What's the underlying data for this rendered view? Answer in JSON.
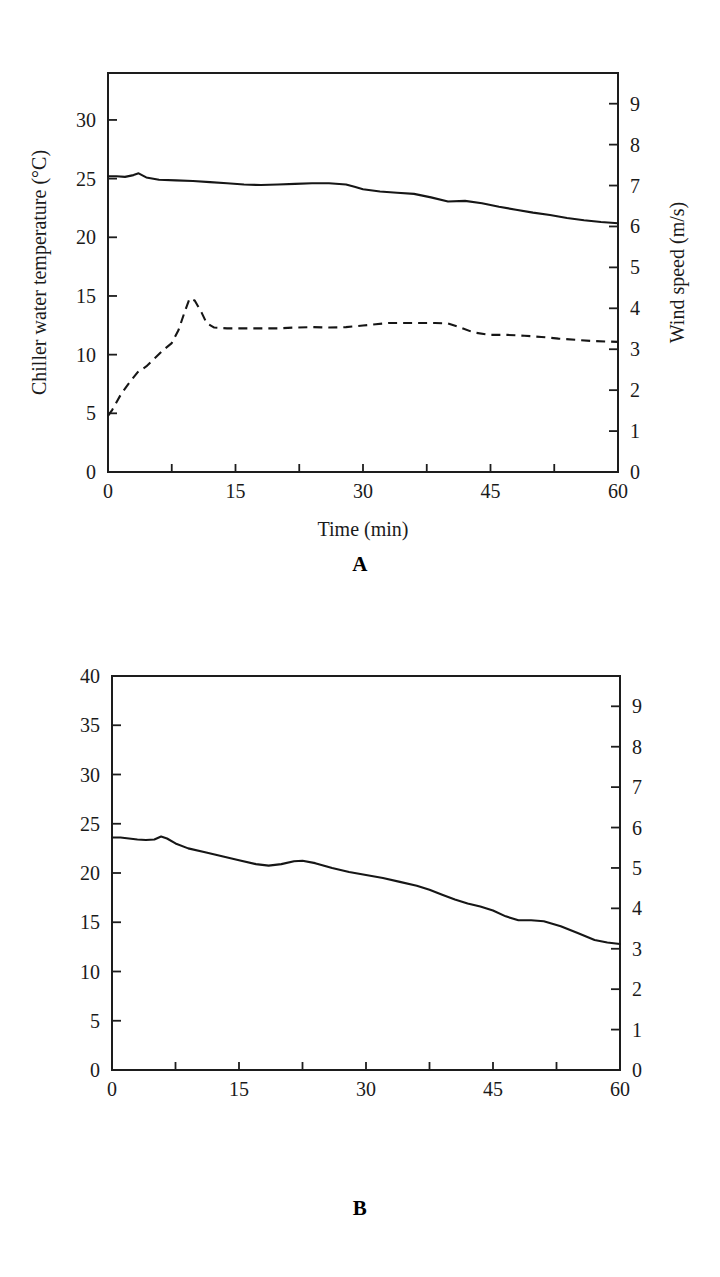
{
  "figure": {
    "panel_a_label": "A",
    "panel_b_label": "B"
  },
  "chart_data": [
    {
      "id": "panel-a",
      "type": "line",
      "title": "",
      "panel_label": "A",
      "xlabel": "Time (min)",
      "ylabel": "Chiller water temperature (°C)",
      "y2label": "Wind speed (m/s)",
      "xlim": [
        0,
        60
      ],
      "ylim": [
        0,
        34
      ],
      "y2lim": [
        0,
        9.75
      ],
      "xticks": [
        0,
        7.5,
        15,
        22.5,
        30,
        37.5,
        45,
        52.5,
        60
      ],
      "xticklabels": [
        "0",
        "",
        "15",
        "",
        "30",
        "",
        "45",
        "",
        "60"
      ],
      "yticks": [
        0,
        5,
        10,
        15,
        20,
        25,
        30
      ],
      "yticklabels": [
        "0",
        "5",
        "10",
        "15",
        "20",
        "25",
        "30"
      ],
      "y2ticks": [
        0,
        1,
        2,
        3,
        4,
        5,
        6,
        7,
        8,
        9
      ],
      "y2ticklabels": [
        "0",
        "1",
        "2",
        "3",
        "4",
        "5",
        "6",
        "7",
        "8",
        "9"
      ],
      "grid": false,
      "legend": "none",
      "series": [
        {
          "name": "Chiller water temperature",
          "style": "solid",
          "axis": "left",
          "unit": "°C",
          "x": [
            0,
            1,
            2,
            3,
            3.6,
            4.5,
            6,
            8,
            10,
            12,
            14,
            16,
            18,
            20,
            22,
            24,
            26,
            28,
            29,
            30,
            32,
            34,
            36,
            38,
            40,
            42,
            44,
            46,
            48,
            50,
            52,
            54,
            56,
            58,
            60
          ],
          "y": [
            25.2,
            25.2,
            25.15,
            25.3,
            25.45,
            25.1,
            24.9,
            24.85,
            24.8,
            24.7,
            24.6,
            24.5,
            24.45,
            24.5,
            24.55,
            24.6,
            24.6,
            24.5,
            24.3,
            24.1,
            23.9,
            23.8,
            23.7,
            23.4,
            23.05,
            23.1,
            22.9,
            22.6,
            22.35,
            22.1,
            21.9,
            21.65,
            21.45,
            21.3,
            21.2
          ]
        },
        {
          "name": "Wind speed",
          "style": "dashed",
          "axis": "right",
          "unit": "m/s",
          "x": [
            0,
            0.5,
            1.5,
            2.5,
            3.5,
            4.5,
            5.5,
            6.5,
            7.5,
            8.3,
            9,
            9.6,
            10.2,
            11,
            11.6,
            12.5,
            14,
            16,
            18,
            20,
            22,
            24,
            26,
            28,
            30,
            31.5,
            33,
            35,
            37,
            38.5,
            40,
            41.5,
            43,
            45,
            47,
            49,
            51,
            53,
            55,
            57,
            60
          ],
          "y_left_equiv": [
            4.8,
            5.3,
            6.6,
            7.6,
            8.5,
            9.0,
            9.7,
            10.4,
            11.0,
            12.1,
            13.6,
            14.8,
            14.6,
            13.6,
            12.7,
            12.3,
            12.25,
            12.25,
            12.25,
            12.25,
            12.3,
            12.35,
            12.3,
            12.35,
            12.5,
            12.6,
            12.7,
            12.7,
            12.7,
            12.7,
            12.65,
            12.3,
            11.9,
            11.7,
            11.7,
            11.6,
            11.5,
            11.35,
            11.25,
            11.15,
            11.1
          ],
          "y": [
            1.37,
            1.52,
            1.89,
            2.18,
            2.44,
            2.58,
            2.78,
            2.98,
            3.15,
            3.47,
            3.9,
            4.24,
            4.19,
            3.9,
            3.64,
            3.53,
            3.51,
            3.51,
            3.51,
            3.51,
            3.53,
            3.54,
            3.53,
            3.54,
            3.58,
            3.61,
            3.64,
            3.64,
            3.64,
            3.64,
            3.63,
            3.53,
            3.41,
            3.35,
            3.35,
            3.33,
            3.3,
            3.26,
            3.23,
            3.2,
            3.18
          ]
        }
      ]
    },
    {
      "id": "panel-b",
      "type": "line",
      "title": "",
      "panel_label": "B",
      "xlabel": "Time (min)",
      "ylabel": "Chiller water temperature (°C)",
      "y2label": "Wind speed (m/s)",
      "xlim": [
        0,
        60
      ],
      "ylim": [
        0,
        40
      ],
      "y2lim": [
        0,
        9.75
      ],
      "xticks": [
        0,
        7.5,
        15,
        22.5,
        30,
        37.5,
        45,
        52.5,
        60
      ],
      "xticklabels": [
        "0",
        "",
        "15",
        "",
        "30",
        "",
        "45",
        "",
        "60"
      ],
      "yticks": [
        0,
        5,
        10,
        15,
        20,
        25,
        30,
        35,
        40
      ],
      "yticklabels": [
        "0",
        "5",
        "10",
        "15",
        "20",
        "25",
        "30",
        "35",
        "40"
      ],
      "y2ticks": [
        0,
        1,
        2,
        3,
        4,
        5,
        6,
        7,
        8,
        9
      ],
      "y2ticklabels": [
        "0",
        "1",
        "2",
        "3",
        "4",
        "5",
        "6",
        "7",
        "8",
        "9"
      ],
      "grid": false,
      "legend": "none",
      "series": [
        {
          "name": "Chiller water temperature",
          "style": "solid",
          "axis": "left",
          "unit": "°C",
          "x": [
            0,
            1,
            2,
            3,
            4,
            5,
            5.8,
            6.5,
            7.5,
            9,
            11,
            13,
            15,
            17,
            18.5,
            20,
            21.5,
            22.5,
            24,
            26,
            28,
            30,
            32,
            34,
            36,
            37.5,
            39,
            40.5,
            42,
            43.5,
            45,
            46.5,
            48,
            49.5,
            51,
            53,
            55,
            57,
            58.5,
            60
          ],
          "y": [
            23.6,
            23.6,
            23.5,
            23.4,
            23.35,
            23.4,
            23.7,
            23.5,
            23.0,
            22.5,
            22.1,
            21.7,
            21.3,
            20.9,
            20.75,
            20.9,
            21.2,
            21.25,
            21.0,
            20.5,
            20.1,
            19.8,
            19.5,
            19.1,
            18.7,
            18.3,
            17.8,
            17.3,
            16.9,
            16.6,
            16.2,
            15.6,
            15.2,
            15.2,
            15.1,
            14.6,
            13.9,
            13.2,
            12.95,
            12.8
          ]
        },
        {
          "name": "Wind speed",
          "style": "dashed",
          "axis": "right",
          "unit": "m/s",
          "x": [
            0,
            0.6,
            1.2,
            2,
            3,
            4,
            5,
            6,
            7,
            8.5,
            10,
            11.5,
            12.5,
            13.5,
            14.5,
            15.3,
            16,
            17,
            18,
            19.5,
            21,
            22.5,
            24,
            26,
            28,
            30,
            32,
            34,
            36,
            37.5,
            39,
            40.5,
            42,
            43,
            44.5,
            46,
            47.5,
            49,
            50.5,
            52,
            53.5,
            55,
            56.5,
            58,
            60
          ],
          "y_left_equiv": [
            6.5,
            7.3,
            8.6,
            9.8,
            10.9,
            11.8,
            12.6,
            13.3,
            13.8,
            14.0,
            14.0,
            14.2,
            14.8,
            15.6,
            16.0,
            15.8,
            15.0,
            13.7,
            13.1,
            12.8,
            12.75,
            12.8,
            13.0,
            13.3,
            13.5,
            13.6,
            13.6,
            13.55,
            13.7,
            14.4,
            15.3,
            15.9,
            15.6,
            15.0,
            14.3,
            13.7,
            13.4,
            13.3,
            13.35,
            13.6,
            14.0,
            14.5,
            14.9,
            15.1,
            15.2
          ]
        }
      ]
    }
  ]
}
